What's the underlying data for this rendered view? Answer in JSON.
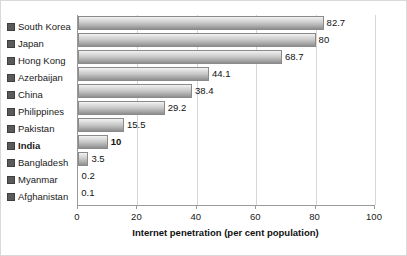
{
  "chart_data": {
    "type": "bar",
    "orientation": "horizontal",
    "title": "",
    "xlabel": "Internet penetration (per cent population)",
    "ylabel": "",
    "xlim": [
      0,
      100
    ],
    "xticks": [
      "0",
      "20",
      "40",
      "60",
      "80",
      "100"
    ],
    "grid": true,
    "legend": "none",
    "categories": [
      "South Korea",
      "Japan",
      "Hong Kong",
      "Azerbaijan",
      "China",
      "Philippines",
      "Pakistan",
      "India",
      "Bangladesh",
      "Myanmar",
      "Afghanistan"
    ],
    "values": [
      82.7,
      80,
      68.7,
      44.1,
      38.4,
      29.2,
      15.5,
      10,
      3.5,
      0.2,
      0.1
    ],
    "value_labels": [
      "82.7",
      "80",
      "68.7",
      "44.1",
      "38.4",
      "29.2",
      "15.5",
      "10",
      "3.5",
      "0.2",
      "0.1"
    ],
    "highlight_category": "India",
    "bar_fill_top": "#f2f2f2",
    "bar_fill_bottom": "#8e8e8e",
    "bar_border": "#8a8a8a",
    "gridline_color": "#d6d6d6",
    "axis_color": "#9a9a9a",
    "text_color": "#111111",
    "marker_icon": "square-bullet-icon"
  }
}
